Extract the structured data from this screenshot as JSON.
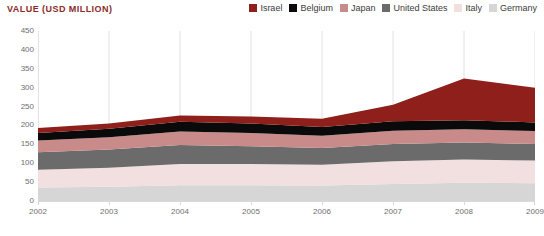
{
  "chart_title": "VALUE (USD MILLION)",
  "title_color": "#8c2b2b",
  "legend": {
    "position": "top-right",
    "items": [
      {
        "label": "Israel",
        "color": "#8e1f1b"
      },
      {
        "label": "Belgium",
        "color": "#0a0a0a"
      },
      {
        "label": "Japan",
        "color": "#c98a8a"
      },
      {
        "label": "United States",
        "color": "#6b6b6b"
      },
      {
        "label": "Italy",
        "color": "#f2dfdf"
      },
      {
        "label": "Germany",
        "color": "#d6d6d6"
      }
    ]
  },
  "chart_data": {
    "type": "area",
    "stacked": true,
    "title": "VALUE (USD MILLION)",
    "xlabel": "",
    "ylabel": "VALUE (USD MILLION)",
    "x": [
      2002,
      2003,
      2004,
      2005,
      2006,
      2007,
      2008,
      2009
    ],
    "categories": [
      "2002",
      "2003",
      "2004",
      "2005",
      "2006",
      "2007",
      "2008",
      "2009"
    ],
    "xtick_labels": [
      "2002",
      "2003",
      "2004",
      "2005",
      "2006",
      "2007",
      "2008",
      "2009"
    ],
    "ytick_labels": [
      "0",
      "50",
      "100",
      "150",
      "200",
      "250",
      "300",
      "350",
      "400",
      "450"
    ],
    "yticks": [
      0,
      50,
      100,
      150,
      200,
      250,
      300,
      350,
      400,
      450
    ],
    "ylim": [
      0,
      450
    ],
    "xlim": [
      2002,
      2009
    ],
    "grid": "vertical",
    "stack_order_bottom_to_top": [
      "Germany",
      "Italy",
      "United States",
      "Japan",
      "Belgium",
      "Israel"
    ],
    "series": [
      {
        "name": "Germany",
        "color": "#d6d6d6",
        "values": [
          36,
          38,
          42,
          42,
          41,
          45,
          48,
          47
        ]
      },
      {
        "name": "Italy",
        "color": "#f2dfdf",
        "values": [
          47,
          50,
          56,
          56,
          55,
          60,
          62,
          60
        ]
      },
      {
        "name": "United States",
        "color": "#6b6b6b",
        "values": [
          46,
          48,
          50,
          47,
          44,
          46,
          45,
          44
        ]
      },
      {
        "name": "Japan",
        "color": "#c98a8a",
        "values": [
          31,
          33,
          36,
          35,
          33,
          35,
          35,
          34
        ]
      },
      {
        "name": "Belgium",
        "color": "#0a0a0a",
        "values": [
          20,
          22,
          26,
          25,
          23,
          25,
          24,
          23
        ]
      },
      {
        "name": "Israel",
        "color": "#8e1f1b",
        "values": [
          13,
          14,
          16,
          19,
          22,
          44,
          110,
          92
        ]
      }
    ],
    "totals": [
      193,
      205,
      226,
      224,
      218,
      255,
      324,
      300
    ]
  },
  "axis_style": {
    "tick_color": "#6f6f6f",
    "grid_color": "#e2e2e2",
    "baseline_color": "#d9d9d9"
  }
}
